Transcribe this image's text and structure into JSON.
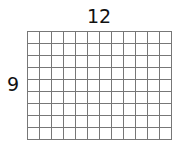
{
  "diagram": {
    "type": "rectangular-array-grid",
    "columns": 12,
    "rows": 9,
    "labels": {
      "top": "12",
      "left": "9"
    },
    "cell_size_px": 12,
    "line_color": "#777777",
    "background": "#ffffff"
  }
}
